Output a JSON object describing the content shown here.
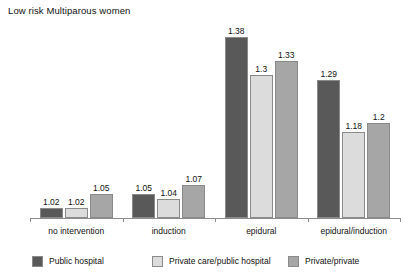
{
  "chart_data": {
    "type": "bar",
    "title": "Low risk Multiparous women",
    "xlabel": "",
    "ylabel": "",
    "ylim": [
      1.0,
      1.42
    ],
    "grid": false,
    "legend_position": "bottom",
    "categories": [
      "no intervention",
      "induction",
      "epidural",
      "epidural/induction"
    ],
    "series": [
      {
        "name": "Public hospital",
        "color": "#595959",
        "values": [
          1.02,
          1.05,
          1.38,
          1.29
        ],
        "labels": [
          "1.02",
          "1.05",
          "1.38",
          "1.29"
        ]
      },
      {
        "name": "Private care/public hospital",
        "color": "#dcdcdc",
        "values": [
          1.02,
          1.04,
          1.3,
          1.18
        ],
        "labels": [
          "1.02",
          "1.04",
          "1.3",
          "1.18"
        ]
      },
      {
        "name": "Private/private",
        "color": "#a6a6a6",
        "values": [
          1.05,
          1.07,
          1.33,
          1.2
        ],
        "labels": [
          "1.05",
          "1.07",
          "1.33",
          "1.2"
        ]
      }
    ]
  },
  "legend": {
    "items": [
      {
        "label": "Public hospital",
        "color": "#595959"
      },
      {
        "label": "Private care/public hospital",
        "color": "#dcdcdc"
      },
      {
        "label": "Private/private",
        "color": "#a6a6a6"
      }
    ]
  }
}
